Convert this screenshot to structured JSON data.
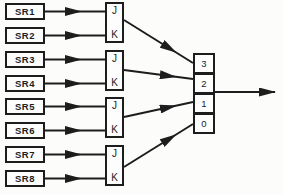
{
  "diagram": {
    "shift_registers": [
      {
        "label": "SR1"
      },
      {
        "label": "SR2"
      },
      {
        "label": "SR3"
      },
      {
        "label": "SR4"
      },
      {
        "label": "SR5"
      },
      {
        "label": "SR6"
      },
      {
        "label": "SR7"
      },
      {
        "label": "SR8"
      }
    ],
    "flip_flops": [
      {
        "j": "J",
        "k": "K"
      },
      {
        "j": "J",
        "k": "K"
      },
      {
        "j": "J",
        "k": "K"
      },
      {
        "j": "J",
        "k": "K"
      }
    ],
    "output_box": {
      "cells": [
        {
          "label": "3"
        },
        {
          "label": "2"
        },
        {
          "label": "1"
        },
        {
          "label": "0"
        }
      ]
    },
    "colors": {
      "line": "#1d1d1d",
      "background": "#fcfcfb",
      "box_fill": "#fdfdfd"
    }
  }
}
